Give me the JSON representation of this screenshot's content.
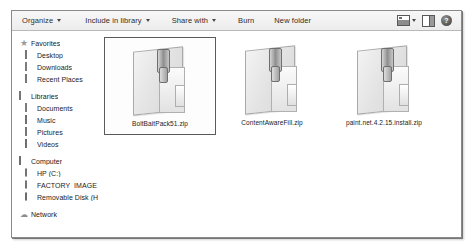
{
  "window": {
    "type": "windows-explorer"
  },
  "toolbar": {
    "items": [
      {
        "label": "Organize",
        "has_caret": true,
        "name": "organize"
      },
      {
        "label": "Include in library",
        "has_caret": true,
        "name": "include-in-library"
      },
      {
        "label": "Share with",
        "has_caret": true,
        "name": "share-with"
      },
      {
        "label": "Burn",
        "has_caret": false,
        "name": "burn"
      },
      {
        "label": "New folder",
        "has_caret": false,
        "name": "new-folder"
      }
    ],
    "right_icons": [
      {
        "name": "change-view-icon"
      },
      {
        "name": "change-view-caret-icon"
      },
      {
        "name": "show-preview-pane-icon"
      },
      {
        "name": "help-icon",
        "glyph": "?"
      }
    ]
  },
  "sidebar": {
    "groups": [
      {
        "header": {
          "label": "Favorites",
          "icon": "star-icon"
        },
        "items": [
          {
            "label": "Desktop",
            "icon": "desktop-icon"
          },
          {
            "label": "Downloads",
            "icon": "downloads-icon"
          },
          {
            "label": "Recent Places",
            "icon": "recent-places-icon"
          }
        ]
      },
      {
        "header": {
          "label": "Libraries",
          "icon": "libraries-icon"
        },
        "items": [
          {
            "label": "Documents",
            "icon": "documents-icon"
          },
          {
            "label": "Music",
            "icon": "music-icon"
          },
          {
            "label": "Pictures",
            "icon": "pictures-icon"
          },
          {
            "label": "Videos",
            "icon": "videos-icon"
          }
        ]
      },
      {
        "header": {
          "label": "Computer",
          "icon": "computer-icon"
        },
        "items": [
          {
            "label": "HP (C:)",
            "icon": "hard-drive-icon"
          },
          {
            "label": "FACTORY_IMAGE (D",
            "icon": "hard-drive-icon"
          },
          {
            "label": "Removable Disk (H:)",
            "icon": "removable-disk-icon"
          }
        ]
      },
      {
        "header": {
          "label": "Network",
          "icon": "network-icon"
        },
        "items": []
      }
    ]
  },
  "content": {
    "files": [
      {
        "name": "BoltBaitPack51.zip",
        "icon": "zip-archive-icon",
        "selected": true
      },
      {
        "name": "ContentAwareFill.zip",
        "icon": "zip-archive-icon",
        "selected": false
      },
      {
        "name": "paint.net.4.2.15.install.zip",
        "icon": "zip-archive-icon",
        "selected": false
      }
    ]
  },
  "colors": {
    "window_border": "#8a8a8a",
    "toolbar_bg": "#f2f2f2",
    "content_bg": "#ffffff",
    "selection_border": "#5a5a5a",
    "text": "#1c1c1c"
  }
}
